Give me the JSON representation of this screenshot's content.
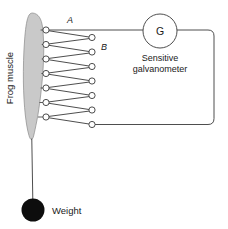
{
  "figure": {
    "background_color": "#ffffff",
    "line_color": "#3a3a3a",
    "muscle_fill_color": "#c9c9c9",
    "muscle_stroke_color": "#8a8a8a",
    "weight_color": "#0d0d0d",
    "node_fill_color": "#ffffff"
  },
  "labels": {
    "muscle": "Frog muscle",
    "terminal_a": "A",
    "terminal_b": "B",
    "meter_symbol": "G",
    "meter_caption_line1": "Sensitive",
    "meter_caption_line2": "galvanometer",
    "weight": "Weight"
  },
  "electrodes": {
    "count_left": 7,
    "count_right": 7,
    "left_x": 46,
    "right_x": 92,
    "radius": 3.1,
    "left_y": [
      30,
      44.5,
      59,
      73.5,
      88,
      102.5,
      117
    ],
    "right_y": [
      37.5,
      52,
      66.5,
      81,
      95.5,
      110,
      124.5
    ]
  },
  "galvanometer": {
    "center_x": 160,
    "center_y": 31,
    "radius": 17
  },
  "weight": {
    "center_x": 33,
    "center_y": 210,
    "radius": 11.5
  },
  "circuit": {
    "top_wire_y": 30,
    "bottom_wire_y": 124.5,
    "right_wire_x": 214,
    "corner_radius": 6
  }
}
